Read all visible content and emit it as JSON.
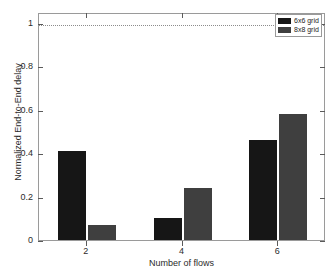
{
  "chart_data": {
    "type": "bar",
    "title": "",
    "subtitle": "",
    "xlabel": "Number of flows",
    "ylabel": "Normalized End-to-End delay",
    "categories": [
      "2",
      "4",
      "6"
    ],
    "series": [
      {
        "name": "6x6 grid",
        "color": "#161616",
        "values": [
          0.41,
          0.1,
          0.46
        ]
      },
      {
        "name": "8x8 grid",
        "color": "#3f3f3f",
        "values": [
          0.07,
          0.24,
          0.58
        ]
      }
    ],
    "ylim": [
      0,
      1.05
    ],
    "yticks": [
      0,
      0.2,
      0.4,
      0.6,
      0.8,
      1
    ],
    "ytick_labels": [
      "0",
      "0.2",
      "0.4",
      "0.6",
      "0.8",
      "1"
    ],
    "xticks": [
      2,
      4,
      6
    ],
    "xtick_labels": [
      "2",
      "4",
      "6"
    ],
    "xlim": [
      1,
      7
    ],
    "grid": false,
    "legend_position": "top-right",
    "annotations": [
      {
        "type": "hline",
        "y": 1.0,
        "style": "dotted",
        "color": "#8c8c8c"
      }
    ]
  }
}
